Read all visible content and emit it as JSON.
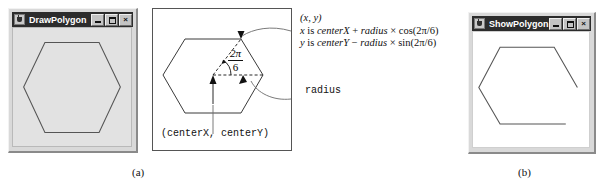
{
  "figure": {
    "caption_a": "(a)",
    "caption_b": "(b)"
  },
  "left_window": {
    "title": "DrawPolygon",
    "icon": "java-cup-icon",
    "buttons": {
      "minimize": "_",
      "maximize": "□",
      "close": "×"
    },
    "canvas": {
      "shape": "closed-hexagon",
      "background": "#e2e2e2",
      "stroke": "#555555"
    }
  },
  "right_window": {
    "title": "ShowPolygon",
    "icon": "java-cup-icon",
    "buttons": {
      "minimize": "_",
      "maximize": "□",
      "close": "×"
    },
    "canvas": {
      "shape": "open-hexagon-polyline",
      "background": "#ffffff",
      "stroke": "#555555"
    }
  },
  "diagram": {
    "point_label": "(x, y)",
    "formula_x_prefix": "x",
    "formula_x_is": " is ",
    "formula_x_centerx": "centerX",
    "formula_x_plus": " + ",
    "formula_x_radius": "radius",
    "formula_x_times": " × ",
    "formula_x_trig": "cos(2π/6)",
    "formula_y_prefix": "y",
    "formula_y_is": " is ",
    "formula_y_centery": "centerY",
    "formula_y_minus": " − ",
    "formula_y_radius": "radius",
    "formula_y_times": " × ",
    "formula_y_trig": "sin(2π/6)",
    "radius_label": "radius",
    "center_label": "(centerX, centerY)",
    "angle_numerator": "2π",
    "angle_denominator": "6"
  },
  "colors": {
    "titlebar": "#2c2c2c",
    "titlebar_text": "#ffffff",
    "window_face": "#d9d9d9",
    "canvas_gray": "#e2e2e2",
    "stroke": "#555555",
    "ink": "#111111"
  }
}
